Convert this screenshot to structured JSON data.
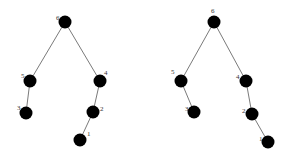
{
  "diagram": {
    "type": "tree-comparison",
    "node_color": "#000000",
    "edge_color": "#7a7a7a",
    "trees": [
      {
        "id": "left-tree",
        "nodes": [
          {
            "label": "6",
            "x": 65,
            "y": 22,
            "lx": -9,
            "ly": -2
          },
          {
            "label": "5",
            "x": 30,
            "y": 81,
            "lx": -9,
            "ly": -3
          },
          {
            "label": "3",
            "x": 26,
            "y": 113,
            "lx": -9,
            "ly": -3
          },
          {
            "label": "4",
            "x": 100,
            "y": 81,
            "lx": 4,
            "ly": -6
          },
          {
            "label": "2",
            "x": 93,
            "y": 112,
            "lx": 7,
            "ly": -1
          },
          {
            "label": "1",
            "x": 80,
            "y": 140,
            "lx": 7,
            "ly": -4
          }
        ],
        "edges": [
          [
            "6",
            "5"
          ],
          [
            "6",
            "4"
          ],
          [
            "5",
            "3"
          ],
          [
            "4",
            "2"
          ],
          [
            "2",
            "1"
          ]
        ]
      },
      {
        "id": "right-tree",
        "nodes": [
          {
            "label": "6",
            "x": 214,
            "y": 22,
            "lx": -3,
            "ly": -9
          },
          {
            "label": "5",
            "x": 181,
            "y": 81,
            "lx": -10,
            "ly": -7
          },
          {
            "label": "3",
            "x": 194,
            "y": 112,
            "lx": -9,
            "ly": -1
          },
          {
            "label": "4",
            "x": 246,
            "y": 81,
            "lx": -10,
            "ly": -2
          },
          {
            "label": "2",
            "x": 252,
            "y": 114,
            "lx": -10,
            "ly": -1
          },
          {
            "label": "1",
            "x": 268,
            "y": 142,
            "lx": -9,
            "ly": -1
          }
        ],
        "edges": [
          [
            "6",
            "5"
          ],
          [
            "6",
            "4"
          ],
          [
            "5",
            "3"
          ],
          [
            "4",
            "2"
          ],
          [
            "2",
            "1"
          ]
        ]
      }
    ]
  }
}
